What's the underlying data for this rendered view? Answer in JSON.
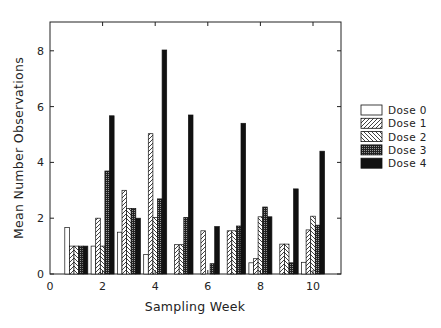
{
  "chart_data": {
    "type": "bar",
    "title": "",
    "xlabel": "Sampling Week",
    "ylabel": "Mean Number Observations",
    "categories": [
      1,
      2,
      3,
      4,
      5,
      6,
      7,
      8,
      9,
      10
    ],
    "xlim": [
      0,
      11
    ],
    "ylim": [
      0,
      9
    ],
    "xticks": [
      0,
      2,
      4,
      6,
      8,
      10
    ],
    "yticks": [
      0,
      2,
      4,
      6,
      8
    ],
    "grid": false,
    "legend_position": "right",
    "series": [
      {
        "name": "Dose 0",
        "pattern": "open",
        "values": [
          1.67,
          1.0,
          1.5,
          0.7,
          0,
          0,
          0,
          0.4,
          0,
          0.42
        ]
      },
      {
        "name": "Dose 1",
        "pattern": "forward-hatch",
        "values": [
          1.0,
          2.0,
          3.0,
          5.03,
          1.05,
          1.55,
          1.55,
          0.55,
          1.07,
          1.58
        ]
      },
      {
        "name": "Dose 2",
        "pattern": "back-hatch",
        "values": [
          1.0,
          1.0,
          2.35,
          2.03,
          1.05,
          0,
          1.55,
          2.05,
          1.07,
          2.07
        ]
      },
      {
        "name": "Dose 3",
        "pattern": "crosshatch",
        "values": [
          1.0,
          3.69,
          2.35,
          2.69,
          2.03,
          0.37,
          1.72,
          2.4,
          0.4,
          1.75
        ]
      },
      {
        "name": "Dose 4",
        "pattern": "solid",
        "values": [
          1.0,
          5.67,
          2.0,
          8.03,
          5.7,
          1.7,
          5.4,
          2.05,
          3.05,
          4.4
        ]
      }
    ]
  },
  "axes": {
    "xlabel": "Sampling Week",
    "ylabel": "Mean Number Observations"
  },
  "legend": {
    "items": [
      "Dose 0",
      "Dose 1",
      "Dose 2",
      "Dose 3",
      "Dose 4"
    ]
  }
}
